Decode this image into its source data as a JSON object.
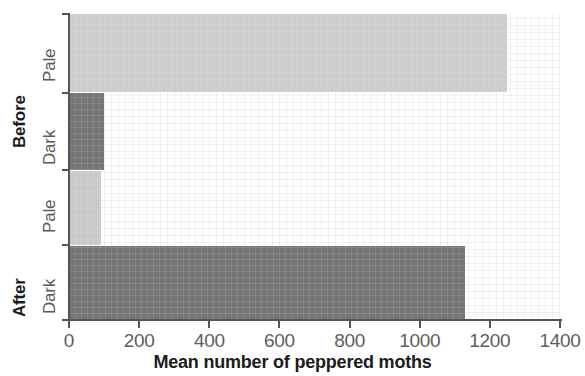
{
  "chart_data": {
    "type": "bar",
    "orientation": "horizontal",
    "title": "",
    "xlabel": "Mean number of peppered moths",
    "ylabel": "",
    "xlim": [
      0,
      1400
    ],
    "xticks": [
      0,
      200,
      400,
      600,
      800,
      1000,
      1200,
      1400
    ],
    "grid": true,
    "legend": "none",
    "categories": [
      "Pale",
      "Dark",
      "Pale",
      "Dark"
    ],
    "groups": [
      "Before",
      "Before",
      "After",
      "After"
    ],
    "values": [
      1250,
      100,
      90,
      1130
    ],
    "bars": [
      {
        "group": "Before",
        "category": "Pale",
        "value": 1250,
        "color": "#cdcdcd"
      },
      {
        "group": "Before",
        "category": "Dark",
        "value": 100,
        "color": "#767676"
      },
      {
        "group": "After",
        "category": "Pale",
        "value": 90,
        "color": "#c9c9c9"
      },
      {
        "group": "After",
        "category": "Dark",
        "value": 1130,
        "color": "#767676"
      }
    ]
  },
  "axis": {
    "x_title": "Mean number of peppered moths",
    "tick_labels": [
      "0",
      "200",
      "400",
      "600",
      "800",
      "1000",
      "1200",
      "1400"
    ]
  },
  "groups": {
    "before_label": "Before",
    "after_label": "After"
  },
  "categories": {
    "before_pale": "Pale",
    "before_dark": "Dark",
    "after_pale": "Pale",
    "after_dark": "Dark"
  },
  "colors": {
    "pale_bar": "#cdcdcd",
    "pale_bar_after": "#c9c9c9",
    "dark_bar": "#767676",
    "axis": "#545454",
    "text": "#5e5e5e",
    "bold_text": "#1c1c1c",
    "background": "#ffffff"
  }
}
